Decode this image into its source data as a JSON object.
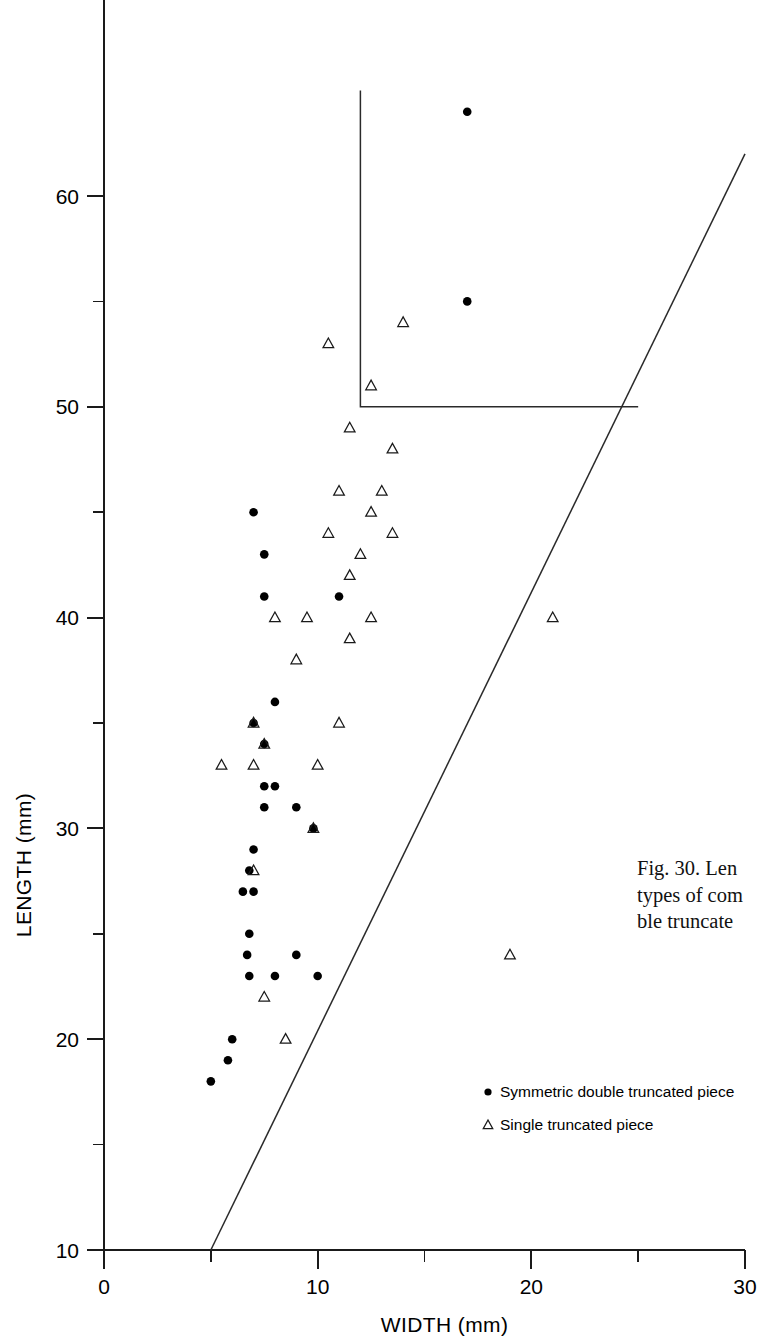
{
  "figure": {
    "caption_lines": [
      "Fig. 30. Len",
      "types of com",
      "ble truncate"
    ]
  },
  "axes": {
    "x_title": "WIDTH  (mm)",
    "y_title": "LENGTH  (mm)",
    "x_tick_labels": [
      "0",
      "10",
      "20",
      "30"
    ],
    "y_tick_labels": [
      "10",
      "20",
      "30",
      "40",
      "50",
      "60"
    ]
  },
  "legend": {
    "items": [
      {
        "marker": "filled-circle",
        "label": "Symmetric double truncated piece"
      },
      {
        "marker": "open-triangle",
        "label": "Single truncated piece"
      }
    ]
  },
  "chart_data": {
    "type": "scatter",
    "title": "",
    "xlabel": "WIDTH  (mm)",
    "ylabel": "LENGTH  (mm)",
    "xlim": [
      0,
      30
    ],
    "ylim": [
      10,
      65
    ],
    "grid": false,
    "legend_position": "inside-bottom-right",
    "x_ticks_major": [
      0,
      10,
      20,
      30
    ],
    "x_ticks_minor": [
      5,
      15,
      25
    ],
    "y_ticks_major": [
      10,
      20,
      30,
      40,
      50,
      60
    ],
    "y_ticks_minor": [
      15,
      25,
      35,
      45,
      55
    ],
    "series": [
      {
        "name": "Symmetric double truncated piece",
        "marker": "filled-circle",
        "points": [
          [
            17,
            64
          ],
          [
            17,
            55
          ],
          [
            7,
            45
          ],
          [
            7.5,
            43
          ],
          [
            7.5,
            41
          ],
          [
            11,
            41
          ],
          [
            8,
            36
          ],
          [
            7,
            35
          ],
          [
            7.5,
            34
          ],
          [
            7.5,
            32
          ],
          [
            8,
            32
          ],
          [
            7.5,
            31
          ],
          [
            9,
            31
          ],
          [
            9.8,
            30
          ],
          [
            7,
            29
          ],
          [
            6.8,
            28
          ],
          [
            6.5,
            27
          ],
          [
            7,
            27
          ],
          [
            6.8,
            25
          ],
          [
            6.7,
            24
          ],
          [
            9,
            24
          ],
          [
            6.8,
            23
          ],
          [
            8,
            23
          ],
          [
            10,
            23
          ],
          [
            6,
            20
          ],
          [
            5.8,
            19
          ],
          [
            5,
            18
          ]
        ]
      },
      {
        "name": "Single truncated piece",
        "marker": "open-triangle",
        "points": [
          [
            14,
            54
          ],
          [
            10.5,
            53
          ],
          [
            12.5,
            51
          ],
          [
            11.5,
            49
          ],
          [
            13.5,
            48
          ],
          [
            11,
            46
          ],
          [
            13,
            46
          ],
          [
            12.5,
            45
          ],
          [
            10.5,
            44
          ],
          [
            13.5,
            44
          ],
          [
            12,
            43
          ],
          [
            11.5,
            42
          ],
          [
            8,
            40
          ],
          [
            9.5,
            40
          ],
          [
            12.5,
            40
          ],
          [
            21,
            40
          ],
          [
            11.5,
            39
          ],
          [
            9,
            38
          ],
          [
            11,
            35
          ],
          [
            7,
            35
          ],
          [
            7.5,
            34
          ],
          [
            5.5,
            33
          ],
          [
            7,
            33
          ],
          [
            10,
            33
          ],
          [
            9.8,
            30
          ],
          [
            7,
            28
          ],
          [
            7.5,
            22
          ],
          [
            19,
            24
          ],
          [
            8.5,
            20
          ]
        ]
      }
    ],
    "boundary_lines": [
      {
        "name": "upper-right-threshold-box",
        "path": [
          [
            12,
            65
          ],
          [
            12,
            50
          ],
          [
            25,
            50
          ]
        ]
      },
      {
        "name": "width-length-ratio-diagonal",
        "path": [
          [
            5,
            10
          ],
          [
            30,
            62
          ]
        ]
      }
    ]
  }
}
